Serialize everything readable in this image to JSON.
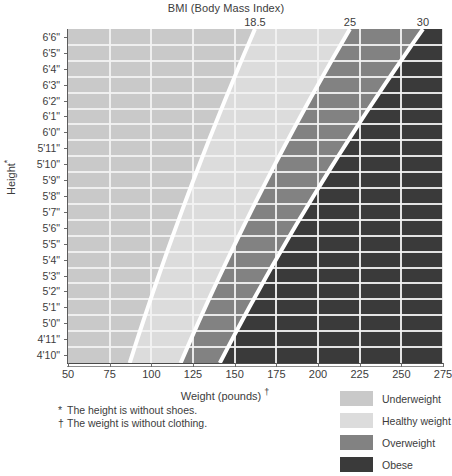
{
  "chart_data": {
    "type": "heatmap",
    "title": "BMI (Body Mass Index)",
    "xlabel": "Weight (pounds)",
    "xlabel_footnote_mark": "†",
    "ylabel": "Height",
    "ylabel_footnote_mark": "*",
    "xlim": [
      50,
      275
    ],
    "ylim_labels": [
      "4'10\"",
      "6'6\""
    ],
    "grid": true,
    "legend_position": "bottom-right",
    "x_ticks": [
      50,
      75,
      100,
      125,
      150,
      175,
      200,
      225,
      250,
      275
    ],
    "x_tick_labels": [
      "50",
      "75",
      "100",
      "125",
      "150",
      "175",
      "200",
      "225",
      "250",
      "275"
    ],
    "y_tick_labels": [
      "6'6\"",
      "6'5\"",
      "6'4\"",
      "6'3\"",
      "6'2\"",
      "6'1\"",
      "6'0\"",
      "5'11\"",
      "5'10\"",
      "5'9\"",
      "5'8\"",
      "5'7\"",
      "5'6\"",
      "5'5\"",
      "5'4\"",
      "5'3\"",
      "5'2\"",
      "5'1\"",
      "5'0\"",
      "4'11\"",
      "4'10\""
    ],
    "y_tick_inches": [
      78,
      77,
      76,
      75,
      74,
      73,
      72,
      71,
      70,
      69,
      68,
      67,
      66,
      65,
      64,
      63,
      62,
      61,
      60,
      59,
      58
    ],
    "bmi_boundaries": [
      18.5,
      25,
      30
    ],
    "bmi_boundary_labels": [
      "18.5",
      "25",
      "30"
    ],
    "bands": [
      {
        "name": "Underweight",
        "bmi_range": "< 18.5",
        "color": "#c9c9c9"
      },
      {
        "name": "Healthy weight",
        "bmi_range": "18.5 – 24.9",
        "color": "#dcdcdc"
      },
      {
        "name": "Overweight",
        "bmi_range": "25 – 29.9",
        "color": "#828282"
      },
      {
        "name": "Obese",
        "bmi_range": "≥ 30",
        "color": "#3a3a3a"
      }
    ],
    "boundary_weight_at_heights": [
      {
        "height": "6'6\"",
        "inches": 78,
        "bmi_18_5": 157.0,
        "bmi_25": 212.2,
        "bmi_30": 254.6
      },
      {
        "height": "6'0\"",
        "inches": 72,
        "bmi_18_5": 133.8,
        "bmi_25": 180.8,
        "bmi_30": 217.0
      },
      {
        "height": "5'6\"",
        "inches": 66,
        "bmi_18_5": 112.4,
        "bmi_25": 151.9,
        "bmi_30": 182.3
      },
      {
        "height": "5'0\"",
        "inches": 60,
        "bmi_18_5": 92.9,
        "bmi_25": 125.6,
        "bmi_30": 150.7
      },
      {
        "height": "4'10\"",
        "inches": 58,
        "bmi_18_5": 86.9,
        "bmi_25": 117.4,
        "bmi_30": 140.9
      }
    ],
    "grid_v_count": 10,
    "grid_h_count": 21
  },
  "header": {
    "bmi_title": "BMI (Body Mass Index)"
  },
  "axes": {
    "x_title": "Weight (pounds)",
    "y_title": "Height"
  },
  "footnotes": [
    {
      "mark": "*",
      "text": "The height is without shoes."
    },
    {
      "mark": "†",
      "text": "The weight is without clothing."
    }
  ],
  "legend": [
    {
      "label": "Underweight",
      "color": "#c9c9c9"
    },
    {
      "label": "Healthy weight",
      "color": "#dcdcdc"
    },
    {
      "label": "Overweight",
      "color": "#828282"
    },
    {
      "label": "Obese",
      "color": "#3a3a3a"
    }
  ],
  "colors": {
    "underweight": "#c9c9c9",
    "healthy": "#dcdcdc",
    "overweight": "#828282",
    "obese": "#3a3a3a",
    "gridline": "#f2f2f2",
    "separator": "#ffffff",
    "text": "#3c3c3c",
    "background": "#ffffff"
  }
}
